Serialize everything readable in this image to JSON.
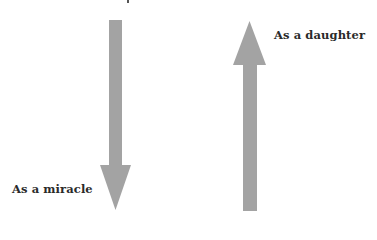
{
  "diagram": {
    "type": "opposing-arrows",
    "arrows": [
      {
        "direction": "down",
        "label": "As a miracle",
        "color": "#a3a3a3"
      },
      {
        "direction": "up",
        "label": "As a daughter",
        "color": "#a3a3a3"
      }
    ]
  },
  "labels": {
    "down_arrow": "As a miracle",
    "up_arrow": "As a daughter"
  }
}
